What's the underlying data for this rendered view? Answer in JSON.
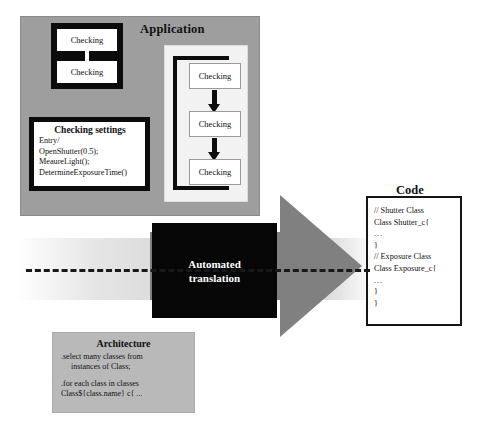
{
  "diagram": {
    "title_application": "Application",
    "title_code": "Code",
    "title_architecture": "Architecture",
    "translation_line1": "Automated",
    "translation_line2": "translation",
    "colors": {
      "application_panel": "#9e9e9e",
      "architecture_panel": "#b9b9b9",
      "arrow": "#808080",
      "translation_box": "#060606",
      "code_border": "#151515"
    }
  },
  "application": {
    "state_pair": {
      "top_label": "Checking",
      "bottom_label": "Checking"
    },
    "settings": {
      "title": "Checking settings",
      "lines": [
        "Entry/",
        "OpenShutter(0.5);",
        "MeaureLight();",
        "DetermineExposureTime()"
      ]
    },
    "flow": {
      "nodes": [
        "Checking",
        "Checking",
        "Checking"
      ]
    }
  },
  "code": {
    "lines": [
      "// Shutter Class",
      "Class Shutter_c{",
      "...",
      "}",
      "// Exposure Class",
      "Class Exposure_c{",
      "...",
      "}",
      "}"
    ]
  },
  "architecture": {
    "lines": [
      ".select many classes from",
      "instances of Class;",
      ".for each class in classes",
      "Class${class.name} c{ ..."
    ]
  }
}
